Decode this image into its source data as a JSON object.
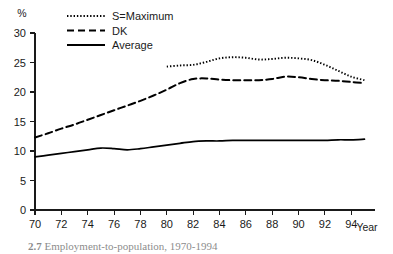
{
  "chart_data": {
    "type": "line",
    "title": "",
    "xlabel": "Year",
    "ylabel": "%",
    "xlim": [
      1970,
      1995.8
    ],
    "ylim": [
      0,
      30
    ],
    "grid": false,
    "legend_position": "top-center",
    "x_ticks": [
      "70",
      "72",
      "74",
      "76",
      "78",
      "80",
      "82",
      "84",
      "86",
      "88",
      "90",
      "92",
      "94"
    ],
    "x_tick_values": [
      1970,
      1972,
      1974,
      1976,
      1978,
      1980,
      1982,
      1984,
      1986,
      1988,
      1990,
      1992,
      1994
    ],
    "y_ticks": [
      "0",
      "5",
      "10",
      "15",
      "20",
      "25",
      "30"
    ],
    "y_tick_values": [
      0,
      5,
      10,
      15,
      20,
      25,
      30
    ],
    "series": [
      {
        "name": "S=Maximum",
        "style": "dotted",
        "x": [
          1980,
          1981,
          1982,
          1983,
          1984,
          1985,
          1986,
          1987,
          1988,
          1989,
          1990,
          1991,
          1992,
          1993,
          1994,
          1995
        ],
        "values": [
          24.3,
          24.5,
          24.6,
          25.1,
          25.7,
          25.9,
          25.8,
          25.5,
          25.6,
          25.8,
          25.7,
          25.4,
          24.6,
          23.6,
          22.6,
          22.0
        ]
      },
      {
        "name": "DK",
        "style": "dashed",
        "x": [
          1970,
          1971,
          1972,
          1973,
          1974,
          1975,
          1976,
          1977,
          1978,
          1979,
          1980,
          1981,
          1982,
          1983,
          1984,
          1985,
          1986,
          1987,
          1988,
          1989,
          1990,
          1991,
          1992,
          1993,
          1994,
          1995
        ],
        "values": [
          12.3,
          13.0,
          13.8,
          14.5,
          15.3,
          16.1,
          16.9,
          17.7,
          18.5,
          19.4,
          20.4,
          21.5,
          22.2,
          22.3,
          22.1,
          22.0,
          22.0,
          22.0,
          22.2,
          22.6,
          22.5,
          22.2,
          22.0,
          21.9,
          21.7,
          21.5
        ]
      },
      {
        "name": "Average",
        "style": "solid",
        "x": [
          1970,
          1971,
          1972,
          1973,
          1974,
          1975,
          1976,
          1977,
          1978,
          1979,
          1980,
          1981,
          1982,
          1983,
          1984,
          1985,
          1986,
          1987,
          1988,
          1989,
          1990,
          1991,
          1992,
          1993,
          1994,
          1995
        ],
        "values": [
          9.0,
          9.3,
          9.6,
          9.9,
          10.2,
          10.5,
          10.4,
          10.2,
          10.4,
          10.7,
          11.0,
          11.3,
          11.6,
          11.7,
          11.7,
          11.8,
          11.8,
          11.8,
          11.8,
          11.8,
          11.8,
          11.8,
          11.8,
          11.9,
          11.9,
          12.0
        ]
      }
    ]
  },
  "legend": {
    "items": [
      {
        "label": "S=Maximum",
        "style": "dotted"
      },
      {
        "label": "DK",
        "style": "dashed"
      },
      {
        "label": "Average",
        "style": "solid"
      }
    ]
  },
  "axis_titles": {
    "y": "%",
    "x": "Year"
  },
  "caption": {
    "number": "2.7",
    "text": "Employment-to-population, 1970-1994"
  }
}
